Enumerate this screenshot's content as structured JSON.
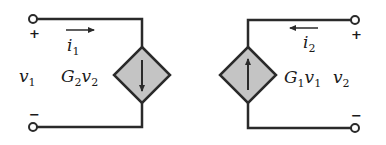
{
  "diagram": {
    "type": "two-port dependent source equivalent circuit",
    "colors": {
      "wire": "#2a2a2a",
      "source_fill": "#c4c4c4",
      "background": "#ffffff"
    },
    "left_port": {
      "voltage": {
        "symbol": "v",
        "sub": "1"
      },
      "current": {
        "symbol": "i",
        "sub": "1",
        "direction": "right"
      },
      "plus": "+",
      "minus": "−",
      "source": {
        "kind": "dependent current source",
        "gain": "G",
        "gain_sub": "2",
        "ctrl": "v",
        "ctrl_sub": "2",
        "arrow": "down"
      }
    },
    "right_port": {
      "voltage": {
        "symbol": "v",
        "sub": "2"
      },
      "current": {
        "symbol": "i",
        "sub": "2",
        "direction": "left"
      },
      "plus": "+",
      "minus": "−",
      "source": {
        "kind": "dependent current source",
        "gain": "G",
        "gain_sub": "1",
        "ctrl": "v",
        "ctrl_sub": "1",
        "arrow": "up"
      }
    }
  }
}
